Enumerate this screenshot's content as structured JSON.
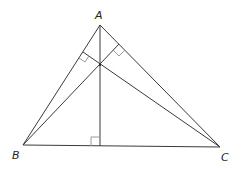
{
  "diagram": {
    "type": "triangle-altitudes-orthocenter",
    "vertices": {
      "A": {
        "label": "A",
        "x": 100,
        "y": 25
      },
      "B": {
        "label": "B",
        "x": 23,
        "y": 145
      },
      "C": {
        "label": "C",
        "x": 220,
        "y": 147
      }
    },
    "orthocenter": {
      "x": 100,
      "y": 65
    },
    "altitude_feet": {
      "from_A": {
        "x": 100,
        "y": 146
      },
      "from_B": {
        "x": 119,
        "y": 44
      },
      "from_C": {
        "x": 83,
        "y": 52
      }
    },
    "right_angle_marks": 3,
    "colors": {
      "line": "#3a3a3a",
      "mark": "#9a9a9a",
      "label": "#222222"
    }
  }
}
